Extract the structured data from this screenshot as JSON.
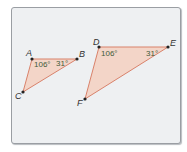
{
  "figure": {
    "triangle_abc": {
      "vertices": {
        "A": "A",
        "B": "B",
        "C": "C"
      },
      "angle_a": "106°",
      "angle_b": "31°"
    },
    "triangle_def": {
      "vertices": {
        "D": "D",
        "E": "E",
        "F": "F"
      },
      "angle_d": "106°",
      "angle_e": "31°"
    },
    "colors": {
      "fill": "#f3d5c8",
      "stroke": "#d9826b",
      "frame_bg": "#eef0f2",
      "vertex": "#222222"
    }
  }
}
